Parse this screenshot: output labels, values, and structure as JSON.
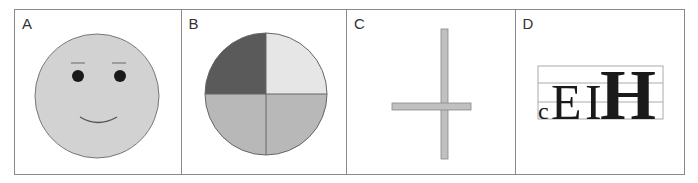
{
  "figure": {
    "panels": [
      {
        "label": "A",
        "content": "smiley-face",
        "fill": "#d2d2d2",
        "eye_color": "#1a1a1a"
      },
      {
        "label": "B",
        "content": "quartered-circle",
        "quadrant_colors": {
          "top_left": "#5a5a5a",
          "top_right": "#e6e6e6",
          "bottom_left": "#b8b8b8",
          "bottom_right": "#b8b8b8"
        }
      },
      {
        "label": "C",
        "content": "cross-shape",
        "fill": "#c0c0c0"
      },
      {
        "label": "D",
        "content": "letters-on-grid",
        "letters": [
          {
            "char": "c",
            "text": "c"
          },
          {
            "char": "E",
            "text": "E"
          },
          {
            "char": "I",
            "text": "I"
          },
          {
            "char": "H",
            "text": "H"
          }
        ]
      }
    ]
  }
}
